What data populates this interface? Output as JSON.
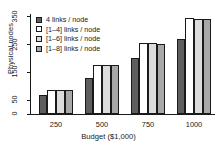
{
  "chart_data": {
    "type": "bar",
    "title": "",
    "xlabel": "Budget ($1,000)",
    "ylabel": "Physical nodes",
    "categories": [
      "250",
      "500",
      "750",
      "1000"
    ],
    "ylim": [
      0,
      360
    ],
    "yticks": [
      "0",
      "50",
      "150",
      "250",
      "350"
    ],
    "ytick_values": [
      0,
      50,
      150,
      250,
      350
    ],
    "grid": false,
    "legend_position": "top-left",
    "series": [
      {
        "name": "4 links / node",
        "values": [
          68,
          130,
          200,
          270
        ],
        "color": "#5e5e5e"
      },
      {
        "name": "[1–4] links / node",
        "values": [
          88,
          178,
          256,
          345
        ],
        "color": "#ffffff"
      },
      {
        "name": "[1–6] links / node",
        "values": [
          88,
          178,
          254,
          343
        ],
        "color": "#dcdcdc"
      },
      {
        "name": "[1–8] links / node",
        "values": [
          88,
          178,
          253,
          342
        ],
        "color": "#a8a8a8"
      }
    ]
  }
}
